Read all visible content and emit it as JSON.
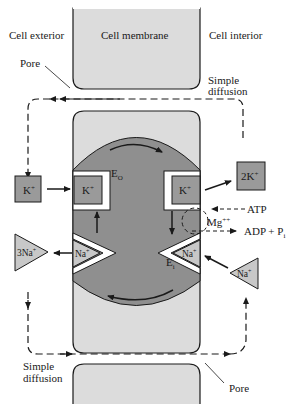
{
  "diagram": {
    "labels": {
      "cell_exterior": "Cell exterior",
      "cell_membrane": "Cell membrane",
      "cell_interior": "Cell interior",
      "pore_top": "Pore",
      "pore_bottom": "Pore",
      "simple_diffusion_top_1": "Simple",
      "simple_diffusion_top_2": "diffusion",
      "simple_diffusion_bottom_1": "Simple",
      "simple_diffusion_bottom_2": "diffusion",
      "eo": "E",
      "eo_sub": "O",
      "ei": "E",
      "ei_sub": "i",
      "atp": "ATP",
      "mg": "Mg",
      "mg_sup": "++",
      "adp": "ADP + P",
      "adp_sub": "i"
    },
    "ions": {
      "k_outside": "K",
      "k_pump_left": "K",
      "k_pump_right": "K",
      "k_released": "2K",
      "na_pump_left": "Na",
      "na_released": "3Na",
      "na_pump_right": "Na",
      "na_inside": "Na",
      "plus": "+"
    },
    "colors": {
      "membrane_light": "#dcdcdc",
      "pump_dark": "#8f8f8f",
      "ion_box": "#9a9a9a",
      "ion_triangle": "#c8c8c8",
      "stroke": "#1a1a1a"
    }
  }
}
